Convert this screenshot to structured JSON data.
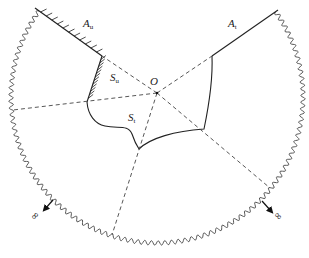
{
  "diagram": {
    "type": "continuum-body-boundary-diagram",
    "labels": {
      "origin": "O",
      "boundary_u": {
        "main": "A",
        "sub": "u"
      },
      "boundary_t": {
        "main": "A",
        "sub": "t"
      },
      "surface_u": {
        "main": "S",
        "sub": "u"
      },
      "surface_t": {
        "main": "S",
        "sub": "t"
      },
      "infinity_left": "∞",
      "infinity_right": "∞"
    },
    "colors": {
      "stroke": "#333333",
      "dashed": "#444444",
      "background": "#ffffff"
    }
  }
}
